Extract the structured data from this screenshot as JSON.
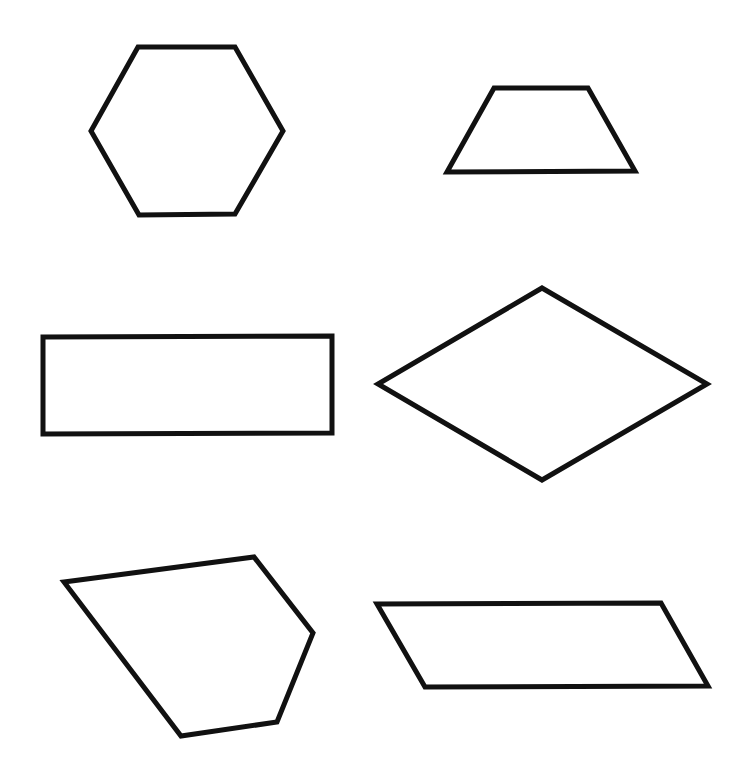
{
  "canvas": {
    "width": 745,
    "height": 763,
    "background": "#ffffff"
  },
  "style": {
    "stroke": "#111111",
    "stroke_width": 5,
    "fill": "#ffffff"
  },
  "shapes": [
    {
      "name": "hexagon",
      "points": "138,47 235,47 283,131 235,214 139,215 91,131"
    },
    {
      "name": "trapezoid",
      "points": "494,88 588,88 635,171 447,172"
    },
    {
      "name": "rectangle",
      "points": "43,337 332,336 332,433 43,434"
    },
    {
      "name": "rhombus",
      "points": "542,288 707,384 542,480 378,384"
    },
    {
      "name": "irregular-pentagon",
      "points": "64,582 254,557 313,633 277,722 181,736"
    },
    {
      "name": "parallelogram",
      "points": "377,604 661,603 708,686 425,687"
    }
  ]
}
